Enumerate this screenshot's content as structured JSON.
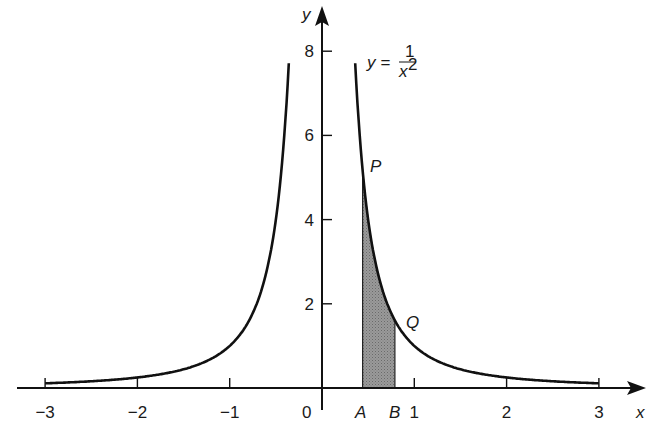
{
  "chart_data": {
    "type": "line",
    "title": "",
    "function_label": {
      "lhs": "y =",
      "numerator": "1",
      "denominator": "x²"
    },
    "xlabel": "x",
    "ylabel": "y",
    "xlim": [
      -3,
      3
    ],
    "ylim": [
      0,
      8
    ],
    "x_ticks": [
      -3,
      -2,
      -1,
      1,
      2,
      3
    ],
    "x_tick_labels": [
      "−3",
      "−2",
      "−1",
      "1",
      "2",
      "3"
    ],
    "origin_label": "0",
    "y_ticks": [
      2,
      4,
      6,
      8
    ],
    "y_tick_labels": [
      "2",
      "4",
      "6",
      "8"
    ],
    "grid": false,
    "series": [
      {
        "name": "y = 1/x² (x<0)",
        "x_range": [
          -3,
          -0.36
        ]
      },
      {
        "name": "y = 1/x² (x>0)",
        "x_range": [
          0.36,
          3
        ]
      }
    ],
    "shaded_region": {
      "from_x": 0.44,
      "to_x": 0.79,
      "under": "y = 1/x²",
      "color": "#8a8a8a"
    },
    "annotations": [
      {
        "text": "P",
        "x": 0.44,
        "y": 5.2
      },
      {
        "text": "Q",
        "x": 0.79,
        "y": 1.6
      },
      {
        "text": "A",
        "x": 0.44,
        "y": 0,
        "position": "below-axis"
      },
      {
        "text": "B",
        "x": 0.79,
        "y": 0,
        "position": "below-axis"
      }
    ]
  },
  "labels": {
    "x_axis": "x",
    "y_axis": "y",
    "origin": "0",
    "point_p": "P",
    "point_q": "Q",
    "point_a": "A",
    "point_b": "B",
    "func_lhs": "y =",
    "func_num": "1",
    "func_den": "x",
    "func_exp": "2",
    "xt": [
      "−3",
      "−2",
      "−1",
      "1",
      "2",
      "3"
    ],
    "yt": [
      "2",
      "4",
      "6",
      "8"
    ]
  }
}
